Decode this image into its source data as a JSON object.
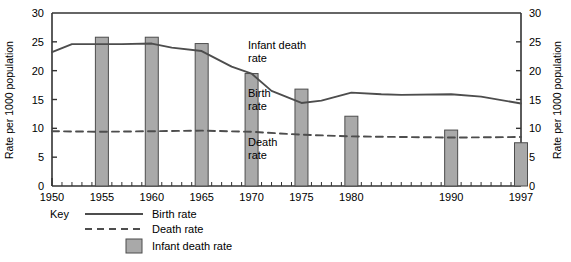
{
  "chart_data": {
    "type": "line",
    "title": "",
    "subtitle": "",
    "xlabel": "",
    "ylabel": "Rate per 1000 population",
    "ylabel_right": "Rate per 1000 population",
    "xlim": [
      1950,
      1997
    ],
    "ylim": [
      0,
      30
    ],
    "grid": false,
    "y_ticks": [
      0,
      5,
      10,
      15,
      20,
      25,
      30
    ],
    "y_tick_labels": [
      "0",
      "5",
      "10",
      "15",
      "20",
      "25",
      "30"
    ],
    "x_tick_labels": [
      "1950",
      "1955",
      "1960",
      "1965",
      "1970",
      "1975",
      "1980",
      "1990",
      "1997"
    ],
    "x_tick_values": [
      1950,
      1955,
      1960,
      1965,
      1970,
      1975,
      1980,
      1990,
      1997
    ],
    "x_minor_tick_interval": 1,
    "legend_position": "below-left",
    "legend_title": "Key",
    "series": [
      {
        "name": "Birth rate",
        "type": "line",
        "style": "solid",
        "color": "#4d4d4d",
        "x": [
          1950,
          1952,
          1955,
          1957,
          1960,
          1962,
          1965,
          1968,
          1970,
          1972,
          1975,
          1977,
          1980,
          1983,
          1985,
          1990,
          1993,
          1997
        ],
        "values": [
          23.2,
          24.6,
          24.6,
          24.6,
          24.7,
          24.0,
          23.4,
          20.7,
          19.5,
          16.5,
          14.4,
          14.8,
          16.2,
          15.9,
          15.8,
          15.9,
          15.5,
          14.3
        ]
      },
      {
        "name": "Death rate",
        "type": "line",
        "style": "dashed",
        "color": "#4d4d4d",
        "x": [
          1950,
          1955,
          1960,
          1965,
          1970,
          1975,
          1980,
          1985,
          1990,
          1997
        ],
        "values": [
          9.5,
          9.4,
          9.5,
          9.6,
          9.4,
          8.9,
          8.6,
          8.5,
          8.4,
          8.5
        ]
      },
      {
        "name": "Infant death rate",
        "type": "bar",
        "color": "#a9a9a9",
        "edge_color": "#4d4d4d",
        "x": [
          1955,
          1960,
          1965,
          1970,
          1975,
          1980,
          1990,
          1997
        ],
        "values": [
          25.8,
          25.8,
          24.7,
          19.5,
          16.8,
          12.1,
          9.7,
          7.5
        ]
      }
    ],
    "annotations": [
      {
        "text_line1": "Infant death",
        "text_line2": "rate",
        "x": 1968.5,
        "y": 24.0
      },
      {
        "text_line1": "Birth",
        "text_line2": "rate",
        "x": 1968.5,
        "y": 16.5
      },
      {
        "text_line1": "Death",
        "text_line2": "rate",
        "x": 1968.5,
        "y": 8.0
      }
    ]
  },
  "legend": {
    "key_label": "Key",
    "items": [
      {
        "label": "Birth rate",
        "marker": "solid-line"
      },
      {
        "label": "Death rate",
        "marker": "dashed-line"
      },
      {
        "label": "Infant death rate",
        "marker": "filled-square"
      }
    ]
  },
  "axis": {
    "left_title": "Rate per 1000 population",
    "right_title": "Rate per 1000 population",
    "y_labels": [
      "30",
      "25",
      "20",
      "15",
      "10",
      "5",
      "0"
    ],
    "x_labels": [
      "1950",
      "1955",
      "1960",
      "1965",
      "1970",
      "1975",
      "1980",
      "1990",
      "1997"
    ]
  },
  "annotations": {
    "infant_line1": "Infant death",
    "infant_line2": "rate",
    "birth_line1": "Birth",
    "birth_line2": "rate",
    "death_line1": "Death",
    "death_line2": "rate"
  },
  "colors": {
    "bar_fill": "#a9a9a9",
    "bar_edge": "#4d4d4d",
    "line": "#4d4d4d",
    "axis": "#333333",
    "background": "#ffffff"
  }
}
